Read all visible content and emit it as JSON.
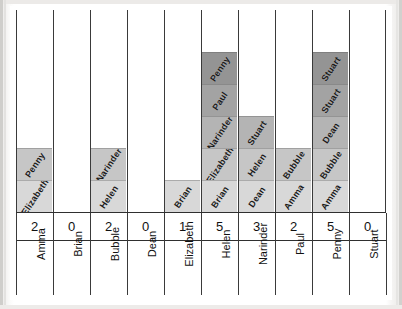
{
  "chart_data": {
    "type": "bar",
    "subtype": "stacked-bar",
    "title": "",
    "xlabel": "",
    "ylabel": "",
    "ylim": [
      0,
      6
    ],
    "grid": false,
    "legend": "none",
    "categories": [
      "Amma",
      "Brian",
      "Bubble",
      "Dean",
      "Elizabeth",
      "Helen",
      "Narinder",
      "Paul",
      "Penny",
      "Stuart"
    ],
    "values": [
      2,
      0,
      2,
      0,
      1,
      5,
      3,
      2,
      5,
      0
    ],
    "count_row_label": "",
    "segment_labels": [
      [
        "Elizabeth",
        "Penny"
      ],
      [],
      [
        "Helen",
        "Narinder"
      ],
      [],
      [
        "Brian"
      ],
      [
        "Brian",
        "Elizabeth",
        "Narinder",
        "Paul",
        "Penny"
      ],
      [
        "Dean",
        "Helen",
        "Stuart"
      ],
      [
        "Amma",
        "Bubble"
      ],
      [
        "Amma",
        "Bubble",
        "Dean",
        "Stuart",
        "Stuart"
      ],
      []
    ],
    "segment_shades": [
      "#d8d8d8",
      "#c6c6c6",
      "#b4b4b4",
      "#a3a3a3",
      "#949494"
    ],
    "background": "#ffffff",
    "axis_color": "#2f2f2f"
  },
  "colors": {
    "axis": "#2f2f2f",
    "grid": "#3a3a3a",
    "text": "#111111",
    "page_background": "#f0efed",
    "chart_background": "#ffffff"
  }
}
